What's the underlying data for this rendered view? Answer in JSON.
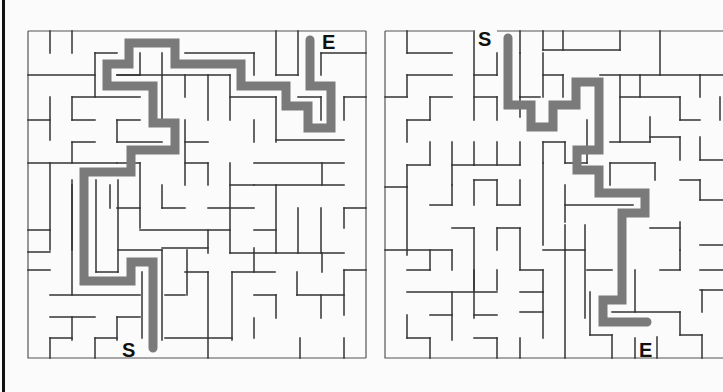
{
  "mazes": [
    {
      "id": "left",
      "start_label": "S",
      "end_label": "E",
      "start_pos": {
        "x": 122,
        "y": 340
      },
      "end_pos": {
        "x": 322,
        "y": 32
      },
      "bounds": {
        "x": 28,
        "y": 31,
        "w": 338,
        "h": 327
      }
    },
    {
      "id": "right",
      "start_label": "S",
      "end_label": "E",
      "start_pos": {
        "x": 478,
        "y": 29
      },
      "end_pos": {
        "x": 639,
        "y": 340
      },
      "bounds": {
        "x": 385,
        "y": 31,
        "w": 338,
        "h": 327
      }
    }
  ],
  "colors": {
    "wall": "#333333",
    "path": "#7a7a7a",
    "background": "#fbfbfb",
    "edge_bar": "#111111"
  }
}
